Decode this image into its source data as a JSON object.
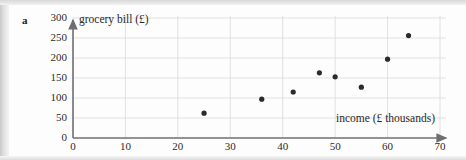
{
  "question_label": "a",
  "chart_data": {
    "type": "scatter",
    "title": "",
    "xlabel": "income (£ thousands)",
    "ylabel": "grocery bill (£)",
    "xlim": [
      0,
      70
    ],
    "ylim": [
      0,
      300
    ],
    "xticks": [
      0,
      10,
      20,
      30,
      40,
      50,
      60,
      70
    ],
    "yticks": [
      0,
      50,
      100,
      150,
      200,
      250,
      300
    ],
    "grid": true,
    "legend": "none",
    "marker_color": "#2b2b2b",
    "grid_color": "#d9d9d9",
    "axis_color": "#6f6f6f",
    "points": [
      {
        "x": 25,
        "y": 62
      },
      {
        "x": 36,
        "y": 97
      },
      {
        "x": 42,
        "y": 115
      },
      {
        "x": 47,
        "y": 163
      },
      {
        "x": 50,
        "y": 153
      },
      {
        "x": 55,
        "y": 127
      },
      {
        "x": 60,
        "y": 197
      },
      {
        "x": 64,
        "y": 256
      }
    ]
  }
}
